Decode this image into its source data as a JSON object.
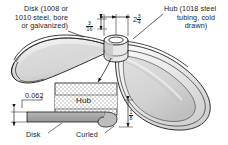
{
  "figure": {
    "background_color": "#ffffff",
    "line_color": "#1a1a1a"
  },
  "labels": {
    "disk_callout": {
      "name": "disk-material-callout",
      "line1": "Disk (1008 or",
      "line2": "1010 steel, bore",
      "line3": "or galvanized)"
    },
    "hub_callout": {
      "name": "hub-material-callout",
      "line1": "Hub (1018 steel",
      "line2": "tubing, cold",
      "line3": "drawn)"
    },
    "hub_section": "Hub",
    "disk_section": "Disk",
    "curled_section": "Curled"
  },
  "dimensions": {
    "hub_wall": {
      "name": "hub-wall-thickness-dimension",
      "whole": "",
      "numerator": "3",
      "denominator": "16",
      "display": "3/16"
    },
    "hub_diameter": {
      "name": "hub-diameter-dimension",
      "whole": "2",
      "numerator": "3",
      "denominator": "4",
      "display": "2 3/4"
    },
    "disk_thickness": {
      "name": "disk-thickness-dimension",
      "value": "0.062"
    },
    "hub_height": {
      "name": "hub-height-dimension",
      "whole": "",
      "numerator": "1",
      "denominator": "8",
      "display": "1/8"
    }
  },
  "colors": {
    "outline": "#1a1a1a",
    "disk_light": "#f4f4f4",
    "disk_mid": "#e2e2e2",
    "disk_shade": "#cfcfcf",
    "disk_dark": "#bdbdbd",
    "plate_fill": "#a9a9a9",
    "hatch_fill": "#d8d8d8",
    "hatch_line": "#8f8f8f"
  }
}
